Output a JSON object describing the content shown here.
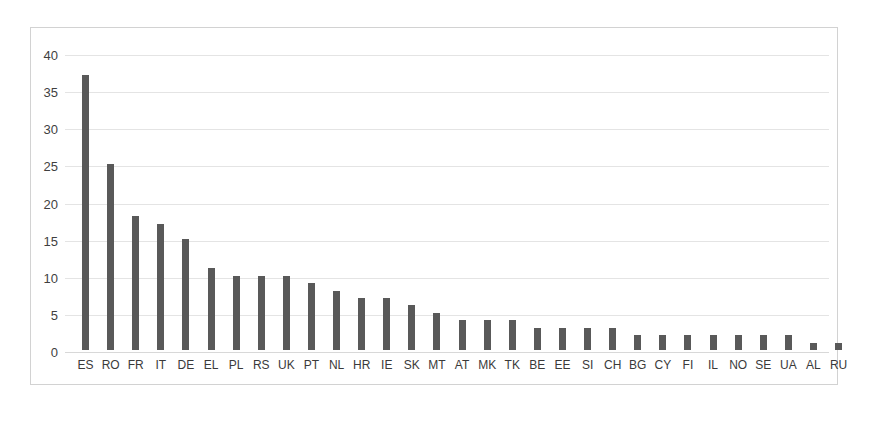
{
  "chart_data": {
    "type": "bar",
    "title": "",
    "subtitle": "",
    "xlabel": "",
    "ylabel": "",
    "ylim": [
      0,
      40
    ],
    "yticks": [
      0,
      5,
      10,
      15,
      20,
      25,
      30,
      35,
      40
    ],
    "ytick_labels": [
      "0",
      "5",
      "10",
      "15",
      "20",
      "25",
      "30",
      "35",
      "40"
    ],
    "grid": true,
    "grid_axis": "y",
    "legend": false,
    "legend_position": "none",
    "bar_color": "#595959",
    "gridline_color": "#e4e4e4",
    "frame_color": "#d2d2d2",
    "background_color": "#ffffff",
    "categories": [
      "ES",
      "RO",
      "FR",
      "IT",
      "DE",
      "EL",
      "PL",
      "RS",
      "UK",
      "PT",
      "NL",
      "HR",
      "IE",
      "SK",
      "MT",
      "AT",
      "MK",
      "TK",
      "BE",
      "EE",
      "SI",
      "CH",
      "BG",
      "CY",
      "FI",
      "IL",
      "NO",
      "SE",
      "UA",
      "AL",
      "RU"
    ],
    "values": [
      37,
      25,
      18,
      17,
      15,
      11,
      10,
      10,
      10,
      9,
      8,
      7,
      7,
      6,
      5,
      4,
      4,
      4,
      3,
      3,
      3,
      3,
      2,
      2,
      2,
      2,
      2,
      2,
      2,
      1,
      1
    ]
  }
}
